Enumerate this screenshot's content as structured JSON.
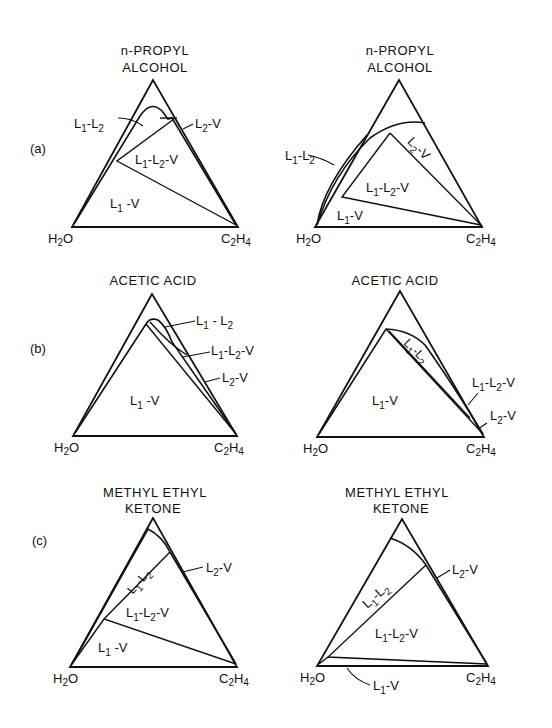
{
  "figure": {
    "rows": [
      {
        "letter": "(a)",
        "left": {
          "title_line1": "n-PROPYL",
          "title_line2": "ALCOHOL",
          "vertex_left": "H",
          "vertex_left_sub": "2",
          "vertex_left_tail": "O",
          "vertex_right": "C",
          "vertex_right_sub": "2",
          "vertex_right_h": "H",
          "vertex_right_sub2": "4",
          "regions": {
            "l1l2": "L1-L2",
            "l2v": "L2-V",
            "l1l2v": "L1-L2-V",
            "l1v": "L1-V"
          }
        },
        "right": {
          "title_line1": "n-PROPYL",
          "title_line2": "ALCOHOL",
          "regions": {
            "l1l2": "L1-L2",
            "l2v": "L2-V",
            "l1l2v": "L1-L2-V",
            "l1v": "L1-V"
          }
        }
      },
      {
        "letter": "(b)",
        "left": {
          "title_line1": "ACETIC ACID",
          "regions": {
            "l1l2": "L1-L2",
            "l1l2v": "L1-L2-V",
            "l2v": "L2-V",
            "l1v": "L1-V"
          }
        },
        "right": {
          "title_line1": "ACETIC ACID",
          "regions": {
            "l1l2": "L1-L2",
            "l1l2v": "L1-L2-V",
            "l2v": "L2-V",
            "l1v": "L1-V"
          }
        }
      },
      {
        "letter": "(c)",
        "left": {
          "title_line1": "METHYL ETHYL",
          "title_line2": "KETONE",
          "regions": {
            "l1l2": "L1-L2",
            "l2v": "L2-V",
            "l1l2v": "L1-L2-V",
            "l1v": "L1-V"
          }
        },
        "right": {
          "title_line1": "METHYL ETHYL",
          "title_line2": "KETONE",
          "regions": {
            "l1l2": "L1-L2",
            "l2v": "L2-V",
            "l1l2v": "L1-L2-V",
            "l1v": "L1-V"
          }
        }
      }
    ],
    "vertices": {
      "left": "H2O",
      "right": "C2H4"
    },
    "symbols": {
      "L": "L",
      "V": "V",
      "dash": "-",
      "one": "1",
      "two": "2",
      "H": "H",
      "O": "O",
      "C": "C",
      "four": "4"
    }
  }
}
